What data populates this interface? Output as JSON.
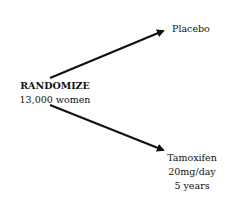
{
  "diagram": {
    "source": {
      "line1": "RANDOMIZE",
      "line2": "13,000 women"
    },
    "arms": [
      {
        "name": "Placebo"
      },
      {
        "name": "Tamoxifen",
        "dose": "20mg/day",
        "duration": "5 years"
      }
    ],
    "colors": {
      "arrow": "#111111",
      "text": "#111111"
    }
  }
}
